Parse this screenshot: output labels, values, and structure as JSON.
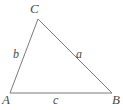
{
  "figure": {
    "type": "triangle-diagram",
    "width": 123,
    "height": 110,
    "background_color": "#ffffff",
    "stroke_color": "#7a7a7a",
    "stroke_width": 1,
    "label_color": "#4a4a4a",
    "vertices": [
      {
        "name": "C",
        "label": "C",
        "x": 38,
        "y": 19
      },
      {
        "name": "A",
        "label": "A",
        "x": 10,
        "y": 93
      },
      {
        "name": "B",
        "label": "B",
        "x": 112,
        "y": 93
      }
    ],
    "sides": [
      {
        "name": "a",
        "label": "a",
        "from": "C",
        "to": "B"
      },
      {
        "name": "b",
        "label": "b",
        "from": "A",
        "to": "C"
      },
      {
        "name": "c",
        "label": "c",
        "from": "A",
        "to": "B"
      }
    ],
    "polygon_points": "38,19 112,93 10,93"
  }
}
